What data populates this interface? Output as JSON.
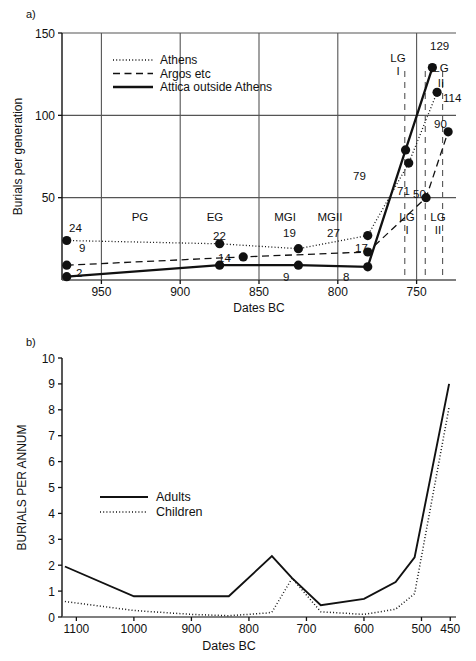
{
  "figure": {
    "panel_a_letter": "a)",
    "panel_b_letter": "b)"
  },
  "chart_data": [
    {
      "id": "panel_a",
      "type": "line",
      "title": "",
      "xlabel": "Dates BC",
      "ylabel": "Burials per generation",
      "xlim": [
        975,
        725
      ],
      "ylim": [
        0,
        150
      ],
      "x_ticks": [
        950,
        900,
        850,
        800,
        750
      ],
      "y_ticks": [
        50,
        100,
        150
      ],
      "grid": true,
      "legend_position": "top-left-inside",
      "legend": [
        {
          "label": "Athens",
          "style": "dotted"
        },
        {
          "label": "Argos etc",
          "style": "dashed"
        },
        {
          "label": "Attica outside Athens",
          "style": "solid"
        }
      ],
      "period_bands": [
        {
          "label": "PG",
          "x_center": 932
        },
        {
          "label": "EG",
          "x_center": 877
        },
        {
          "label": "MGI",
          "x_center": 822
        },
        {
          "label": "MGII",
          "x_center": 783
        },
        {
          "label": "LG\nI",
          "x_center": 746
        },
        {
          "label": "LG\nII",
          "x_center": 733
        }
      ],
      "period_labels_lower": [
        "PG",
        "EG",
        "MGI",
        "MGII",
        "LG I",
        "LG II"
      ],
      "upper_right_labels": [
        "LG I",
        "LG II"
      ],
      "series": [
        {
          "name": "Athens",
          "style": "dotted",
          "x": [
            972,
            875,
            825,
            781,
            755,
            737
          ],
          "values": [
            24,
            22,
            19,
            27,
            71,
            114
          ],
          "point_labels": [
            "24",
            "22",
            "19",
            "27",
            "71",
            "114"
          ]
        },
        {
          "name": "Argos etc",
          "style": "dashed",
          "x": [
            972,
            860,
            781,
            744,
            730
          ],
          "values": [
            9,
            14,
            17,
            50,
            90
          ],
          "point_labels": [
            "9",
            "14",
            "17",
            "50",
            "90"
          ]
        },
        {
          "name": "Attica outside Athens",
          "style": "solid",
          "x": [
            972,
            875,
            825,
            781,
            757,
            740
          ],
          "values": [
            2,
            9,
            9,
            8,
            79,
            129
          ],
          "point_labels": [
            "2",
            "9",
            "9",
            "8",
            "79",
            "129"
          ]
        }
      ],
      "annotations": [
        {
          "text": "24",
          "value": 24
        },
        {
          "text": "9",
          "value": 9
        },
        {
          "text": "2",
          "value": 2
        },
        {
          "text": "22",
          "value": 22
        },
        {
          "text": "14",
          "value": 14
        },
        {
          "text": "19",
          "value": 19
        },
        {
          "text": "9",
          "value": 9
        },
        {
          "text": "27",
          "value": 27
        },
        {
          "text": "17",
          "value": 17
        },
        {
          "text": "8",
          "value": 8
        },
        {
          "text": "79",
          "value": 79
        },
        {
          "text": "71",
          "value": 71
        },
        {
          "text": "50",
          "value": 50
        },
        {
          "text": "129",
          "value": 129
        },
        {
          "text": "114",
          "value": 114
        },
        {
          "text": "90",
          "value": 90
        }
      ]
    },
    {
      "id": "panel_b",
      "type": "line",
      "title": "",
      "xlabel": "Dates BC",
      "ylabel": "BURIALS PER ANNUM",
      "xlim": [
        1125,
        440
      ],
      "ylim": [
        0,
        10
      ],
      "x_ticks": [
        1100,
        1000,
        900,
        800,
        700,
        600,
        500,
        450
      ],
      "y_ticks": [
        0,
        1,
        2,
        3,
        4,
        5,
        6,
        7,
        8,
        9,
        10
      ],
      "grid": false,
      "legend_position": "center-left-inside",
      "legend": [
        {
          "label": "Adults",
          "style": "solid"
        },
        {
          "label": "Children",
          "style": "dotted"
        }
      ],
      "series": [
        {
          "name": "Adults",
          "style": "solid",
          "x": [
            1120,
            1000,
            835,
            760,
            725,
            675,
            600,
            545,
            512,
            452
          ],
          "values": [
            1.95,
            0.8,
            0.8,
            2.35,
            1.5,
            0.45,
            0.7,
            1.35,
            2.3,
            9.0
          ]
        },
        {
          "name": "Children",
          "style": "dotted",
          "x": [
            1120,
            1000,
            900,
            835,
            770,
            760,
            725,
            675,
            600,
            545,
            512,
            452
          ],
          "values": [
            0.6,
            0.25,
            0.1,
            0.05,
            0.15,
            0.18,
            1.5,
            0.2,
            0.1,
            0.3,
            0.9,
            8.1
          ]
        }
      ]
    }
  ],
  "colors": {
    "ink": "#111111",
    "grid": "#555555",
    "background": "#ffffff"
  }
}
